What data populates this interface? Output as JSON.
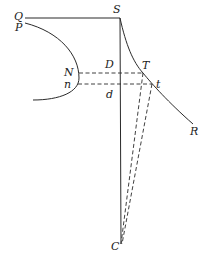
{
  "diagram": {
    "labels": {
      "Q": "Q",
      "P": "P",
      "S": "S",
      "N": "N",
      "n": "n",
      "D": "D",
      "d": "d",
      "T": "T",
      "t": "t",
      "R": "R",
      "C": "C"
    },
    "colors": {
      "line": "#2a2a2a",
      "background": "#ffffff"
    }
  }
}
